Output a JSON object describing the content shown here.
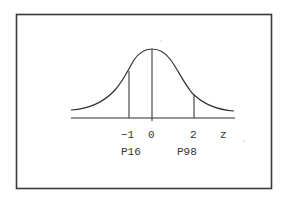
{
  "diagram": {
    "type": "normal-distribution-curve",
    "axis_variable": "z",
    "ticks": [
      {
        "z": -1,
        "label": "-1",
        "percentile_label": "P16"
      },
      {
        "z": 0,
        "label": "0",
        "percentile_label": ""
      },
      {
        "z": 2,
        "label": "2",
        "percentile_label": "P98"
      }
    ],
    "labels": {
      "tick_minus1": "−1",
      "tick_0": "0",
      "tick_2": "2",
      "axis_name": "z",
      "p16": "P16",
      "p98": "P98"
    },
    "colors": {
      "line": "#2e2e2e",
      "frame": "#3a3a3a",
      "text": "#333333",
      "background": "#ffffff"
    }
  }
}
